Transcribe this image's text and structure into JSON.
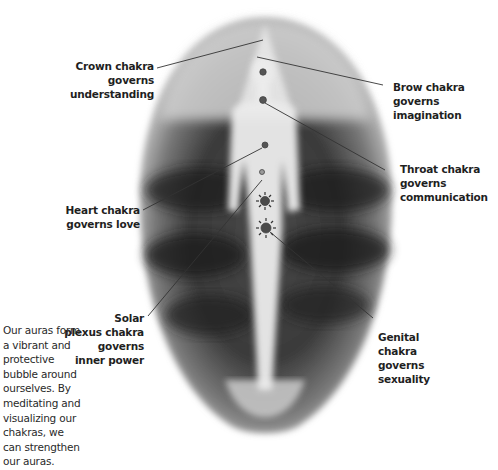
{
  "diagram": {
    "colors": {
      "background": "#ffffff",
      "aura_dark": "#2b2b2b",
      "aura_mid": "#8a8a8a",
      "aura_light": "#d9d9d9",
      "figure": "#eeeeee",
      "chakra": "#555555",
      "leader_line": "#333333",
      "text": "#1f1f1f"
    },
    "labels": {
      "crown": {
        "lines": [
          "Crown chakra",
          "governs",
          "understanding"
        ]
      },
      "brow": {
        "lines": [
          "Brow chakra",
          "governs",
          "imagination"
        ]
      },
      "throat": {
        "lines": [
          "Throat chakra",
          "governs",
          "communication"
        ]
      },
      "heart": {
        "lines": [
          "Heart chakra",
          "governs love"
        ]
      },
      "solar": {
        "lines": [
          "Solar",
          "plexus chakra",
          "governs",
          "inner power"
        ]
      },
      "genital": {
        "lines": [
          "Genital",
          "chakra",
          "governs",
          "sexuality"
        ]
      }
    },
    "caption": {
      "lines": [
        "Our auras form",
        "a vibrant and",
        "protective",
        "bubble around",
        "ourselves. By",
        "meditating and",
        "visualizing our",
        "chakras, we",
        "can strengthen",
        "our auras."
      ]
    }
  }
}
